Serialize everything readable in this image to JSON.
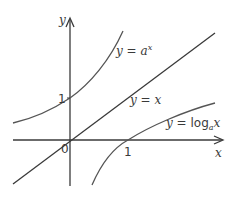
{
  "diagram": {
    "type": "function-graph",
    "axes": {
      "x_label": "x",
      "y_label": "y",
      "origin_label": "0",
      "x_tick_label": "1",
      "y_tick_label": "1"
    },
    "curves": [
      {
        "id": "exponential",
        "label_lhs": "y = ",
        "label_base": "a",
        "label_sup": "x"
      },
      {
        "id": "identity",
        "label": "y = x"
      },
      {
        "id": "logarithm",
        "label_lhs": "y = ",
        "label_fn": "log",
        "label_sub": "a",
        "label_arg": "x"
      }
    ],
    "colors": {
      "axis": "#3a3a3a",
      "line": "#3a3a3a",
      "curve": "#555555"
    }
  }
}
